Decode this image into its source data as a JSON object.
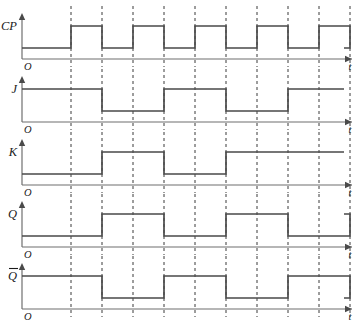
{
  "figure": {
    "type": "timing-diagram",
    "background_color": "#ffffff",
    "signal_color": "#4a4a4a",
    "axis_color": "#6f6f6f",
    "gridline_color": "#3a3a3a"
  },
  "axes": {
    "origin_label": "O",
    "time_axis_label": "t",
    "gridline_count": 10,
    "gridline_style": "dashed"
  },
  "chart_data": {
    "type": "line",
    "xlabel": "t",
    "ylabel": "",
    "grid": true,
    "legend_position": "left-of-axis",
    "x_unit": "clock half-period",
    "x_ticks": [
      0,
      1,
      2,
      3,
      4,
      5,
      6,
      7,
      8,
      9,
      10
    ],
    "levels": {
      "low": 0,
      "high": 1
    },
    "series": [
      {
        "name": "CP",
        "label": "CP",
        "description": "Clock pulse train, five positive pulses",
        "transitions": [
          {
            "x": 0,
            "level": 0
          },
          {
            "x": 1,
            "level": 1
          },
          {
            "x": 2,
            "level": 0
          },
          {
            "x": 3,
            "level": 1
          },
          {
            "x": 4,
            "level": 0
          },
          {
            "x": 5,
            "level": 1
          },
          {
            "x": 6,
            "level": 0
          },
          {
            "x": 7,
            "level": 1
          },
          {
            "x": 8,
            "level": 0
          },
          {
            "x": 9,
            "level": 1
          },
          {
            "x": 10,
            "level": 0
          }
        ]
      },
      {
        "name": "J",
        "label": "J",
        "description": "J input: high, low, high, low, high",
        "transitions": [
          {
            "x": 0,
            "level": 1
          },
          {
            "x": 2,
            "level": 0
          },
          {
            "x": 4,
            "level": 1
          },
          {
            "x": 6,
            "level": 0
          },
          {
            "x": 8,
            "level": 1
          }
        ]
      },
      {
        "name": "K",
        "label": "K",
        "description": "K input: low, high, low, high",
        "transitions": [
          {
            "x": 0,
            "level": 0
          },
          {
            "x": 2,
            "level": 1
          },
          {
            "x": 4,
            "level": 0
          },
          {
            "x": 6,
            "level": 1
          }
        ]
      },
      {
        "name": "Q",
        "label": "Q",
        "description": "Q output toggling at clock edges",
        "transitions": [
          {
            "x": 0,
            "level": 0
          },
          {
            "x": 2,
            "level": 1
          },
          {
            "x": 4,
            "level": 0
          },
          {
            "x": 6,
            "level": 1
          },
          {
            "x": 8,
            "level": 0
          },
          {
            "x": 10,
            "level": 1
          }
        ]
      },
      {
        "name": "Qbar",
        "label": "Q",
        "label_overbar": true,
        "description": "Complement of Q output",
        "transitions": [
          {
            "x": 0,
            "level": 1
          },
          {
            "x": 2,
            "level": 0
          },
          {
            "x": 4,
            "level": 1
          },
          {
            "x": 6,
            "level": 0
          },
          {
            "x": 8,
            "level": 1
          },
          {
            "x": 10,
            "level": 0
          }
        ]
      }
    ]
  }
}
